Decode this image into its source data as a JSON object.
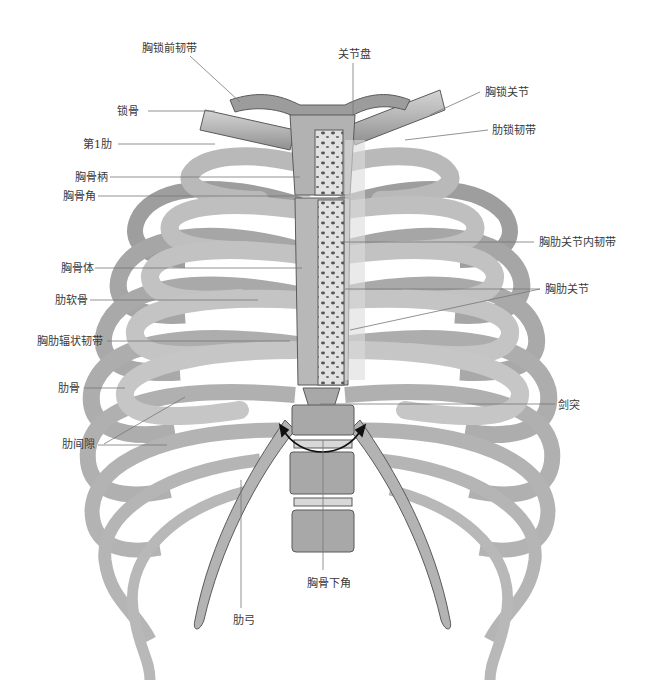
{
  "figure": {
    "labels_left": [
      {
        "id": "sternoclavicular-anterior-ligament",
        "text": "胸锁前韧带",
        "x": 142,
        "y": 42
      },
      {
        "id": "clavicle",
        "text": "锁骨",
        "x": 117,
        "y": 105
      },
      {
        "id": "first-rib",
        "text": "第1肋",
        "x": 83,
        "y": 138
      },
      {
        "id": "manubrium",
        "text": "胸骨柄",
        "x": 75,
        "y": 171
      },
      {
        "id": "sternal-angle",
        "text": "胸骨角",
        "x": 63,
        "y": 190
      },
      {
        "id": "sternal-body",
        "text": "胸骨体",
        "x": 61,
        "y": 262
      },
      {
        "id": "costal-cartilage",
        "text": "肋软骨",
        "x": 55,
        "y": 294
      },
      {
        "id": "radiate-sternocostal-ligament",
        "text": "胸肋辐状韧带",
        "x": 37,
        "y": 335
      },
      {
        "id": "rib",
        "text": "肋骨",
        "x": 58,
        "y": 382
      },
      {
        "id": "intercostal-space",
        "text": "肋间隙",
        "x": 62,
        "y": 438
      }
    ],
    "labels_right": [
      {
        "id": "articular-disc",
        "text": "关节盘",
        "x": 338,
        "y": 48
      },
      {
        "id": "sternoclavicular-joint",
        "text": "胸锁关节",
        "x": 485,
        "y": 86
      },
      {
        "id": "costoclavicular-ligament",
        "text": "肋锁韧带",
        "x": 492,
        "y": 124
      },
      {
        "id": "intra-articular-sternocostal-ligament",
        "text": "胸肋关节内韧带",
        "x": 539,
        "y": 236
      },
      {
        "id": "sternocostal-joint",
        "text": "胸肋关节",
        "x": 545,
        "y": 283
      },
      {
        "id": "xiphoid-process",
        "text": "剑突",
        "x": 558,
        "y": 399
      }
    ],
    "labels_bottom": [
      {
        "id": "infrasternal-angle",
        "text": "胸骨下角",
        "x": 307,
        "y": 577
      },
      {
        "id": "costal-arch",
        "text": "肋弓",
        "x": 233,
        "y": 614
      }
    ],
    "colors": {
      "bone": "#b8b8b8",
      "bone_light": "#d6d6d6",
      "bone_dark": "#8a8a8a",
      "outline": "#5a5a5a",
      "leader_line": "#777777",
      "label_text": "#3a3a3a",
      "arrow": "#111111"
    }
  }
}
